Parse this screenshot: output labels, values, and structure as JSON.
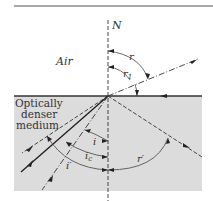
{
  "figure": {
    "labels": {
      "normal": "N",
      "upper_medium": "Air",
      "lower_medium_line1": "Optically",
      "lower_medium_line2": "denser",
      "lower_medium_line3": "medium",
      "angle_r": "r",
      "angle_r1": "r",
      "angle_r1_sub": "1",
      "angle_i": "i",
      "angle_ic": "i",
      "angle_ic_sub": "c",
      "angle_i_prime": "i′",
      "angle_r_prime": "r′"
    },
    "colors": {
      "denser_medium_fill": "#dcdcdc",
      "line": "#333333",
      "top_rule": "#555555"
    }
  }
}
